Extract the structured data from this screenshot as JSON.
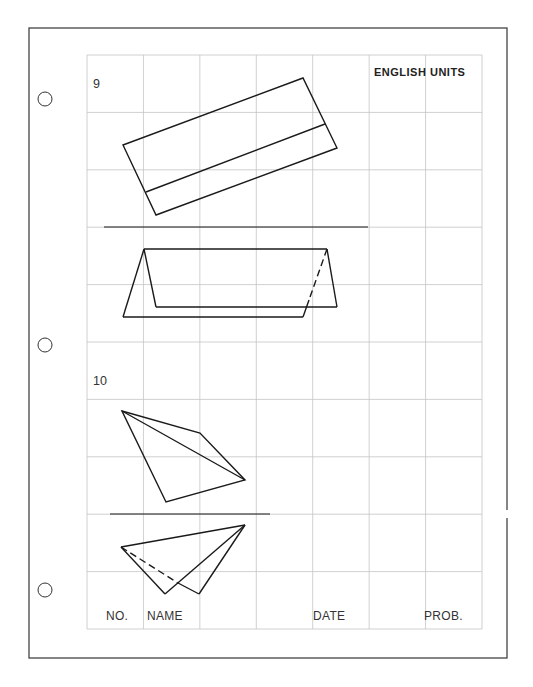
{
  "sheet": {
    "header": {
      "units_label": "ENGLISH UNITS"
    },
    "problems": [
      {
        "number": "9",
        "top_view": {
          "outline": [
            [
              123,
              145
            ],
            [
              303,
              78
            ],
            [
              337,
              148
            ],
            [
              156,
              215
            ]
          ],
          "inner_line": [
            [
              146,
              192
            ],
            [
              325,
              124
            ]
          ]
        },
        "reference_line": [
          [
            104,
            227
          ],
          [
            368,
            227
          ]
        ],
        "front_view": {
          "top_edge": [
            [
              144,
              249
            ],
            [
              327,
              249
            ]
          ],
          "left_outer": [
            [
              144,
              249
            ],
            [
              123,
              317
            ]
          ],
          "left_inner": [
            [
              144,
              249
            ],
            [
              156,
              307
            ]
          ],
          "inner_bottom": [
            [
              156,
              307
            ],
            [
              337,
              307
            ]
          ],
          "right_outer": [
            [
              327,
              249
            ],
            [
              337,
              307
            ]
          ],
          "outer_bottom": [
            [
              123,
              317
            ],
            [
              303,
              317
            ]
          ],
          "hidden_edge": [
            [
              327,
              249
            ],
            [
              309,
              300
            ]
          ],
          "visible_edge": [
            [
              309,
              300
            ],
            [
              303,
              317
            ]
          ]
        }
      },
      {
        "number": "10",
        "top_view": {
          "outline": [
            [
              122,
              411
            ],
            [
              200,
              433
            ],
            [
              245,
              480
            ],
            [
              166,
              502
            ]
          ],
          "diagonal": [
            [
              122,
              411
            ],
            [
              245,
              480
            ]
          ]
        },
        "reference_line": [
          [
            110,
            514
          ],
          [
            270,
            514
          ]
        ],
        "front_view": {
          "top_edge": [
            [
              121,
              547
            ],
            [
              245,
              525
            ]
          ],
          "left_edge": [
            [
              121,
              547
            ],
            [
              165,
              594
            ]
          ],
          "cross_edge": [
            [
              165,
              594
            ],
            [
              245,
              525
            ]
          ],
          "right_edge": [
            [
              199,
              594
            ],
            [
              245,
              525
            ]
          ],
          "hidden_edge": [
            [
              121,
              547
            ],
            [
              178,
              583
            ]
          ],
          "visible_edge": [
            [
              178,
              583
            ],
            [
              199,
              594
            ]
          ]
        }
      }
    ],
    "footer": {
      "no_label": "NO.",
      "name_label": "NAME",
      "date_label": "DATE",
      "prob_label": "PROB."
    },
    "grid": {
      "left": 87,
      "top": 55,
      "right": 482,
      "bottom": 629,
      "columns": 7,
      "rows": 10,
      "line_color": "#c4c4c4"
    },
    "border": {
      "left": 29,
      "top": 28,
      "right": 507,
      "bottom": 658,
      "color": "#444444"
    },
    "punch_holes": [
      {
        "cx": 45,
        "cy": 99
      },
      {
        "cx": 45,
        "cy": 345
      },
      {
        "cx": 45,
        "cy": 590
      }
    ]
  }
}
